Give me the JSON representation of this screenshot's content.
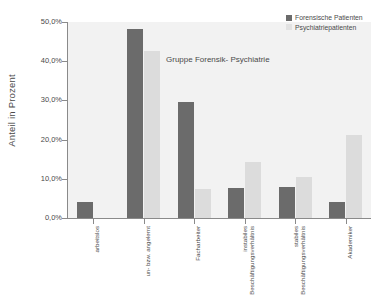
{
  "chart_data": {
    "type": "bar",
    "title": "",
    "annotation": "Gruppe Forensik- Psychiatrie",
    "xlabel": "",
    "ylabel": "Anteil in Prozent",
    "ylim": [
      0,
      50
    ],
    "ytick_labels": [
      "50,0%",
      "40,0%",
      "30,0%",
      "20,0%",
      "10,0%",
      "0,0%"
    ],
    "ytick_values": [
      50,
      40,
      30,
      20,
      10,
      0
    ],
    "grid": false,
    "legend_position": "top-right",
    "categories": [
      "arbeitslos",
      "un- bzw. angelernt",
      "Facharbeiter",
      "instabiles Beschäftigungsverhältnis",
      "stabiles Beschäftigungsverhältnis",
      "Akademiker"
    ],
    "category_lines": [
      [
        "arbeitslos"
      ],
      [
        "un- bzw. angelernt"
      ],
      [
        "Facharbeiter"
      ],
      [
        "instabiles",
        "Beschäftigungsverhältnis"
      ],
      [
        "stabiles",
        "Beschäftigungsverhältnis"
      ],
      [
        "Akademiker"
      ]
    ],
    "series": [
      {
        "name": "Forensische Patienten",
        "color": "#6b6b6b",
        "values": [
          4.2,
          48.2,
          29.6,
          7.7,
          7.8,
          4.1
        ]
      },
      {
        "name": "Psychiatriepatienten",
        "color": "#dcdcdc",
        "values": [
          0.0,
          42.7,
          7.4,
          14.2,
          10.5,
          21.2
        ]
      }
    ]
  },
  "legend": {
    "items": [
      {
        "label": "Forensische Patienten",
        "swatch": "dark"
      },
      {
        "label": "Psychiatriepatienten",
        "swatch": "light"
      }
    ]
  },
  "colors": {
    "series_dark": "#6b6b6b",
    "series_light": "#dcdcdc",
    "plot_background": "#f2f2f2",
    "axis": "#8a8a8a",
    "text": "#4a4a4a"
  }
}
